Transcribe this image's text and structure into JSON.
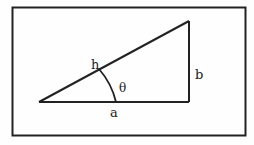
{
  "diagram": {
    "type": "right-triangle",
    "frame": {
      "x": 12,
      "y": 7,
      "width": 234,
      "height": 129,
      "stroke": "#222222"
    },
    "triangle": {
      "vertices": {
        "left": [
          39,
          102
        ],
        "right_angle": [
          189,
          102
        ],
        "top": [
          189,
          21
        ]
      },
      "stroke": "#222222"
    },
    "angle_arc": {
      "center": [
        39,
        102
      ],
      "radius": 77,
      "label": "θ"
    },
    "labels": {
      "hypotenuse": "h",
      "adjacent": "a",
      "opposite": "b",
      "angle": "θ"
    }
  }
}
